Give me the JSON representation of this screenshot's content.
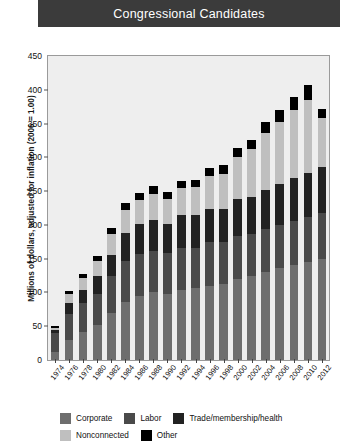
{
  "header": {
    "title": "Congressional Candidates"
  },
  "legend": {
    "rows": [
      [
        {
          "label": "Corporate",
          "color": "#6e6e6e",
          "icon": "legend-swatch-corporate"
        },
        {
          "label": "Labor",
          "color": "#4a4a4a",
          "icon": "legend-swatch-labor"
        },
        {
          "label": "Trade/membership/health",
          "color": "#222222",
          "icon": "legend-swatch-trade"
        }
      ],
      [
        {
          "label": "Nonconnected",
          "color": "#bfbfbf",
          "icon": "legend-swatch-nonconnected"
        },
        {
          "label": "Other",
          "color": "#000000",
          "icon": "legend-swatch-other"
        }
      ]
    ]
  },
  "chart_data": {
    "type": "bar",
    "subtype": "stacked",
    "title": "Congressional Candidates",
    "xlabel": "",
    "ylabel": "Millions of dollars, adjusted for inflation (2006 = 1.00)",
    "ylim": [
      0,
      450
    ],
    "yticks": [
      0,
      50,
      100,
      150,
      200,
      250,
      300,
      350,
      400,
      450
    ],
    "ytick_labels": [
      "0",
      "50",
      "100",
      "150",
      "200",
      "250",
      "300",
      "350",
      "400",
      "450"
    ],
    "grid": false,
    "legend_position": "bottom",
    "categories": [
      "1974",
      "1976",
      "1978",
      "1980",
      "1982",
      "1984",
      "1986",
      "1988",
      "1990",
      "1992",
      "1994",
      "1996",
      "1998",
      "2000",
      "2002",
      "2004",
      "2006",
      "2008",
      "2010",
      "2012"
    ],
    "series": [
      {
        "name": "Corporate",
        "color": "#6e6e6e",
        "values": [
          12,
          30,
          42,
          52,
          70,
          86,
          95,
          100,
          98,
          104,
          106,
          110,
          112,
          120,
          124,
          130,
          136,
          140,
          145,
          150
        ]
      },
      {
        "name": "Labor",
        "color": "#4a4a4a",
        "values": [
          28,
          38,
          42,
          46,
          54,
          60,
          62,
          62,
          60,
          62,
          60,
          64,
          62,
          64,
          62,
          64,
          64,
          66,
          66,
          68
        ]
      },
      {
        "name": "Trade/membership/health",
        "color": "#222222",
        "values": [
          5,
          16,
          20,
          26,
          32,
          42,
          44,
          46,
          44,
          48,
          48,
          50,
          50,
          54,
          56,
          58,
          60,
          64,
          66,
          68
        ]
      },
      {
        "name": "Nonconnected",
        "color": "#bfbfbf",
        "values": [
          3,
          14,
          18,
          22,
          30,
          34,
          36,
          38,
          36,
          40,
          42,
          48,
          52,
          62,
          70,
          84,
          92,
          100,
          108,
          72
        ]
      },
      {
        "name": "Other",
        "color": "#000000",
        "values": [
          2,
          4,
          6,
          8,
          9,
          10,
          10,
          11,
          10,
          11,
          10,
          12,
          12,
          14,
          14,
          16,
          18,
          20,
          22,
          14
        ]
      }
    ],
    "totals": [
      50,
      102,
      128,
      154,
      195,
      232,
      247,
      257,
      248,
      265,
      266,
      284,
      288,
      314,
      326,
      352,
      370,
      390,
      407,
      372
    ]
  }
}
